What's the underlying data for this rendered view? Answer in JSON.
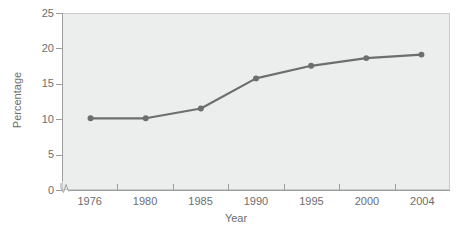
{
  "chart_data": {
    "type": "line",
    "title": "",
    "subtitle": "",
    "xlabel": "Year",
    "ylabel": "Percentage",
    "x": [
      1976,
      1980,
      1985,
      1990,
      1995,
      2000,
      2004
    ],
    "x_tick_labels": [
      "1976",
      "1980",
      "1985",
      "1990",
      "1995",
      "2000",
      "2004"
    ],
    "y_tick_labels": [
      "0",
      "5",
      "10",
      "15",
      "20",
      "25"
    ],
    "y_ticks": [
      0,
      5,
      10,
      15,
      20,
      25
    ],
    "ylim": [
      0,
      25
    ],
    "xlim": [
      1974,
      2006
    ],
    "values": [
      10.1,
      10.1,
      11.5,
      15.8,
      17.6,
      18.7,
      19.2
    ],
    "series": [
      {
        "name": "Percentage",
        "values": [
          10.1,
          10.1,
          11.5,
          15.8,
          17.6,
          18.7,
          19.2
        ]
      }
    ],
    "grid": false,
    "legend": "none",
    "axis_break": "y-axis-zero-break",
    "marker": "circle",
    "colors": {
      "line": "#6e6e70",
      "marker": "#6e6e70",
      "plot_background": "#eceded",
      "plot_border": "#c9cbcc",
      "axis": "#9a9c9d",
      "text": "#6b6d6e",
      "figure_background": "#ffffff"
    }
  },
  "axes": {
    "y": {
      "title": "Percentage",
      "ticks": [
        {
          "label": "25",
          "value": 25
        },
        {
          "label": "20",
          "value": 20
        },
        {
          "label": "15",
          "value": 15
        },
        {
          "label": "10",
          "value": 10
        },
        {
          "label": "5",
          "value": 5
        },
        {
          "label": "0",
          "value": 0
        }
      ]
    },
    "x": {
      "title": "Year",
      "ticks": [
        {
          "label": "1976",
          "value": 1976
        },
        {
          "label": "1980",
          "value": 1980
        },
        {
          "label": "1985",
          "value": 1985
        },
        {
          "label": "1990",
          "value": 1990
        },
        {
          "label": "1995",
          "value": 1995
        },
        {
          "label": "2000",
          "value": 2000
        },
        {
          "label": "2004",
          "value": 2004
        }
      ]
    }
  }
}
